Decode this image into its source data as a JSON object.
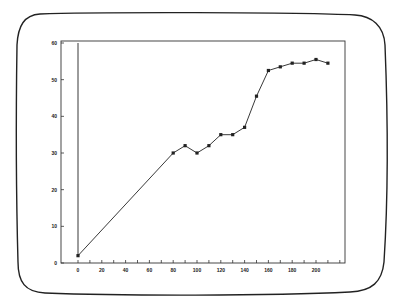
{
  "chart_data": {
    "type": "line",
    "title": "",
    "xlabel": "",
    "ylabel": "",
    "xlim": [
      0,
      225
    ],
    "ylim": [
      0,
      60
    ],
    "grid": false,
    "legend": null,
    "x_ticks": [
      0,
      20,
      40,
      60,
      80,
      100,
      120,
      140,
      160,
      180,
      200
    ],
    "x_tick_labels": [
      "0",
      "20",
      "40",
      "60",
      "80",
      "100",
      "120",
      "140",
      "160",
      "180",
      "200"
    ],
    "y_ticks": [
      0,
      10,
      20,
      30,
      40,
      50,
      60
    ],
    "y_tick_labels": [
      "0",
      "10",
      "20",
      "30",
      "40",
      "50",
      "60"
    ],
    "series": [
      {
        "name": "series-1",
        "color": "#222222",
        "marker": "square",
        "x": [
          0,
          0,
          80,
          90,
          100,
          110,
          120,
          130,
          140,
          150,
          160,
          170,
          180,
          190,
          200,
          210
        ],
        "y": [
          60,
          2,
          30,
          32,
          30,
          32,
          35,
          35,
          37,
          45.5,
          52.5,
          53.5,
          54.5,
          54.5,
          55.5,
          54.5
        ],
        "marked": [
          false,
          true,
          true,
          true,
          true,
          true,
          true,
          true,
          true,
          true,
          true,
          true,
          true,
          true,
          true,
          true
        ]
      }
    ]
  },
  "colors": {
    "line": "#222222",
    "frame": "#222222",
    "background": "#ffffff"
  }
}
